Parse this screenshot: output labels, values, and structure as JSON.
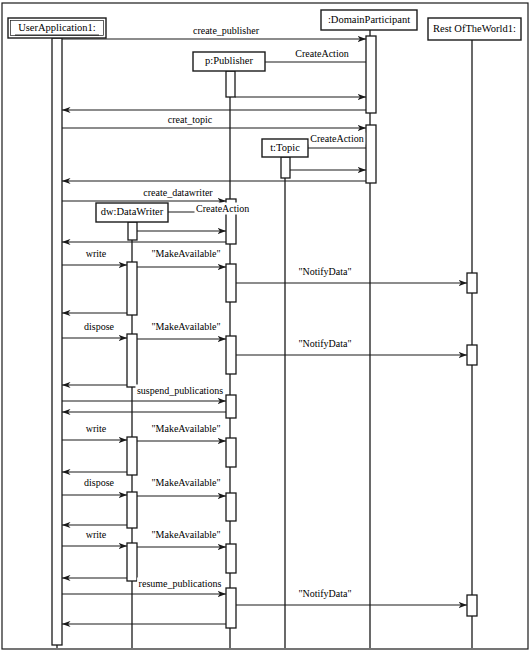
{
  "diagram": {
    "type": "uml-sequence-diagram",
    "title": "",
    "width": 530,
    "height": 654,
    "stroke_color": "#1a1a1a",
    "background_color": "#ffffff"
  },
  "participants": [
    {
      "id": "userapp",
      "label": "UserApplication1:",
      "underlined": true,
      "x": 57,
      "box": {
        "x": 8,
        "y": 18,
        "w": 98,
        "h": 20
      }
    },
    {
      "id": "datawriter",
      "label": "dw:DataWriter",
      "underlined": false,
      "x": 132,
      "box": {
        "x": 96,
        "y": 203,
        "w": 72,
        "h": 19
      }
    },
    {
      "id": "publisher",
      "label": "p:Publisher",
      "underlined": false,
      "x": 230,
      "box": {
        "x": 193,
        "y": 52,
        "w": 72,
        "h": 19
      }
    },
    {
      "id": "topic",
      "label": "t:Topic",
      "underlined": false,
      "x": 285,
      "box": {
        "x": 262,
        "y": 139,
        "w": 46,
        "h": 18
      }
    },
    {
      "id": "domainpart",
      "label": ":DomainParticipant",
      "underlined": false,
      "x": 370,
      "box": {
        "x": 321,
        "y": 10,
        "w": 96,
        "h": 20
      }
    },
    {
      "id": "restworld",
      "label": "Rest OfTheWorld1:",
      "underlined": false,
      "x": 472,
      "box": {
        "x": 428,
        "y": 18,
        "w": 93,
        "h": 22
      }
    }
  ],
  "messages": [
    {
      "id": "m1",
      "label": "create_publisher",
      "from": "userapp",
      "to": "domainpart",
      "y": 39,
      "dir": "right",
      "label_x": 226,
      "label_y": 34
    },
    {
      "id": "m2",
      "label": "CreateAction",
      "from": "domainpart",
      "to": "publisher",
      "y": 62,
      "dir": "left",
      "label_x": 322,
      "label_y": 57
    },
    {
      "id": "m3",
      "label": "",
      "from": "publisher",
      "to": "domainpart",
      "y": 97,
      "dir": "right",
      "label_x": 300,
      "label_y": 92
    },
    {
      "id": "m4",
      "label": "",
      "from": "domainpart",
      "to": "userapp",
      "y": 110,
      "dir": "left",
      "label_x": 200,
      "label_y": 105
    },
    {
      "id": "m5",
      "label": "creat_topic",
      "from": "userapp",
      "to": "domainpart",
      "y": 128,
      "dir": "right",
      "label_x": 190,
      "label_y": 123
    },
    {
      "id": "m6",
      "label": "CreateAction",
      "from": "domainpart",
      "to": "topic",
      "y": 148,
      "dir": "left",
      "label_x": 337,
      "label_y": 142
    },
    {
      "id": "m7",
      "label": "",
      "from": "topic",
      "to": "domainpart",
      "y": 170,
      "dir": "right",
      "label_x": 330,
      "label_y": 165
    },
    {
      "id": "m8",
      "label": "",
      "from": "domainpart",
      "to": "userapp",
      "y": 181,
      "dir": "left",
      "label_x": 200,
      "label_y": 176
    },
    {
      "id": "m9",
      "label": "create_datawriter",
      "from": "userapp",
      "to": "publisher",
      "y": 201,
      "dir": "right",
      "label_x": 178,
      "label_y": 196
    },
    {
      "id": "m10",
      "label": "CreateAction",
      "from": "publisher",
      "to": "datawriter",
      "y": 212,
      "dir": "left",
      "label_x": 196,
      "label_y": 212
    },
    {
      "id": "m11",
      "label": "",
      "from": "datawriter",
      "to": "publisher",
      "y": 231,
      "dir": "right",
      "label_x": 180,
      "label_y": 226
    },
    {
      "id": "m12",
      "label": "",
      "from": "publisher",
      "to": "userapp",
      "y": 242,
      "dir": "left",
      "label_x": 140,
      "label_y": 237
    },
    {
      "id": "m13",
      "label": "write",
      "from": "userapp",
      "to": "datawriter",
      "y": 265,
      "dir": "right",
      "label_x": 96,
      "label_y": 257
    },
    {
      "id": "m14",
      "label": "\"MakeAvailable\"",
      "from": "datawriter",
      "to": "publisher",
      "y": 267,
      "dir": "right",
      "label_x": 186,
      "label_y": 257
    },
    {
      "id": "m15",
      "label": "\"NotifyData\"",
      "from": "publisher",
      "to": "restworld",
      "y": 283,
      "dir": "right",
      "label_x": 325,
      "label_y": 275
    },
    {
      "id": "m16",
      "label": "",
      "from": "datawriter",
      "to": "userapp",
      "y": 313,
      "dir": "left",
      "label_x": 96,
      "label_y": 308
    },
    {
      "id": "m17",
      "label": "dispose",
      "from": "userapp",
      "to": "datawriter",
      "y": 338,
      "dir": "right",
      "label_x": 99,
      "label_y": 330
    },
    {
      "id": "m18",
      "label": "\"MakeAvailable\"",
      "from": "datawriter",
      "to": "publisher",
      "y": 339,
      "dir": "right",
      "label_x": 186,
      "label_y": 330
    },
    {
      "id": "m19",
      "label": "\"NotifyData\"",
      "from": "publisher",
      "to": "restworld",
      "y": 355,
      "dir": "right",
      "label_x": 325,
      "label_y": 347
    },
    {
      "id": "m20",
      "label": "",
      "from": "datawriter",
      "to": "userapp",
      "y": 385,
      "dir": "left",
      "label_x": 96,
      "label_y": 380
    },
    {
      "id": "m21",
      "label": "suspend_publications",
      "from": "userapp",
      "to": "publisher",
      "y": 401,
      "dir": "right",
      "label_x": 180,
      "label_y": 394
    },
    {
      "id": "m22",
      "label": "",
      "from": "publisher",
      "to": "userapp",
      "y": 412,
      "dir": "left",
      "label_x": 140,
      "label_y": 407
    },
    {
      "id": "m23",
      "label": "write",
      "from": "userapp",
      "to": "datawriter",
      "y": 440,
      "dir": "right",
      "label_x": 96,
      "label_y": 432
    },
    {
      "id": "m24",
      "label": "\"MakeAvailable\"",
      "from": "datawriter",
      "to": "publisher",
      "y": 441,
      "dir": "right",
      "label_x": 186,
      "label_y": 432
    },
    {
      "id": "m25",
      "label": "",
      "from": "datawriter",
      "to": "userapp",
      "y": 472,
      "dir": "left",
      "label_x": 96,
      "label_y": 467
    },
    {
      "id": "m26",
      "label": "dispose",
      "from": "userapp",
      "to": "datawriter",
      "y": 495,
      "dir": "right",
      "label_x": 99,
      "label_y": 486
    },
    {
      "id": "m27",
      "label": "\"MakeAvailable\"",
      "from": "datawriter",
      "to": "publisher",
      "y": 496,
      "dir": "right",
      "label_x": 186,
      "label_y": 486
    },
    {
      "id": "m28",
      "label": "",
      "from": "datawriter",
      "to": "userapp",
      "y": 525,
      "dir": "left",
      "label_x": 96,
      "label_y": 520
    },
    {
      "id": "m29",
      "label": "write",
      "from": "userapp",
      "to": "datawriter",
      "y": 546,
      "dir": "right",
      "label_x": 96,
      "label_y": 538
    },
    {
      "id": "m30",
      "label": "\"MakeAvailable\"",
      "from": "datawriter",
      "to": "publisher",
      "y": 547,
      "dir": "right",
      "label_x": 186,
      "label_y": 538
    },
    {
      "id": "m31",
      "label": "",
      "from": "datawriter",
      "to": "userapp",
      "y": 578,
      "dir": "left",
      "label_x": 96,
      "label_y": 573
    },
    {
      "id": "m32",
      "label": "resume_publications",
      "from": "userapp",
      "to": "publisher",
      "y": 594,
      "dir": "right",
      "label_x": 180,
      "label_y": 587
    },
    {
      "id": "m33",
      "label": "\"NotifyData\"",
      "from": "publisher",
      "to": "restworld",
      "y": 605,
      "dir": "right",
      "label_x": 325,
      "label_y": 597
    },
    {
      "id": "m34",
      "label": "",
      "from": "publisher",
      "to": "userapp",
      "y": 624,
      "dir": "left",
      "label_x": 140,
      "label_y": 619
    }
  ],
  "activations": [
    {
      "id": "a-userapp",
      "participant": "userapp",
      "x": 52,
      "y": 38,
      "w": 10,
      "h": 607
    },
    {
      "id": "a-dp-1",
      "participant": "domainpart",
      "x": 366,
      "y": 36,
      "w": 10,
      "h": 77
    },
    {
      "id": "a-pub-create",
      "participant": "publisher",
      "x": 226,
      "y": 71,
      "w": 9,
      "h": 26
    },
    {
      "id": "a-dp-2",
      "participant": "domainpart",
      "x": 366,
      "y": 125,
      "w": 10,
      "h": 58
    },
    {
      "id": "a-topic-create",
      "participant": "topic",
      "x": 281,
      "y": 157,
      "w": 9,
      "h": 21
    },
    {
      "id": "a-pub-2",
      "participant": "publisher",
      "x": 226,
      "y": 199,
      "w": 10,
      "h": 45
    },
    {
      "id": "a-dw-create",
      "participant": "datawriter",
      "x": 128,
      "y": 222,
      "w": 9,
      "h": 18
    },
    {
      "id": "a-dw-w1",
      "participant": "datawriter",
      "x": 127,
      "y": 262,
      "w": 10,
      "h": 53
    },
    {
      "id": "a-pub-w1",
      "participant": "publisher",
      "x": 226,
      "y": 264,
      "w": 10,
      "h": 38
    },
    {
      "id": "a-rw-1",
      "participant": "restworld",
      "x": 467,
      "y": 273,
      "w": 10,
      "h": 20
    },
    {
      "id": "a-dw-d1",
      "participant": "datawriter",
      "x": 127,
      "y": 334,
      "w": 10,
      "h": 53
    },
    {
      "id": "a-pub-d1",
      "participant": "publisher",
      "x": 226,
      "y": 336,
      "w": 10,
      "h": 38
    },
    {
      "id": "a-rw-2",
      "participant": "restworld",
      "x": 467,
      "y": 345,
      "w": 10,
      "h": 20
    },
    {
      "id": "a-pub-susp",
      "participant": "publisher",
      "x": 226,
      "y": 395,
      "w": 10,
      "h": 23
    },
    {
      "id": "a-dw-w2",
      "participant": "datawriter",
      "x": 127,
      "y": 437,
      "w": 10,
      "h": 38
    },
    {
      "id": "a-pub-w2",
      "participant": "publisher",
      "x": 226,
      "y": 438,
      "w": 10,
      "h": 29
    },
    {
      "id": "a-dw-d2",
      "participant": "datawriter",
      "x": 127,
      "y": 492,
      "w": 10,
      "h": 36
    },
    {
      "id": "a-pub-d2",
      "participant": "publisher",
      "x": 226,
      "y": 493,
      "w": 10,
      "h": 28
    },
    {
      "id": "a-dw-w3",
      "participant": "datawriter",
      "x": 127,
      "y": 543,
      "w": 10,
      "h": 38
    },
    {
      "id": "a-pub-w3",
      "participant": "publisher",
      "x": 226,
      "y": 544,
      "w": 10,
      "h": 29
    },
    {
      "id": "a-pub-res",
      "participant": "publisher",
      "x": 226,
      "y": 588,
      "w": 10,
      "h": 40
    },
    {
      "id": "a-rw-3",
      "participant": "restworld",
      "x": 467,
      "y": 595,
      "w": 10,
      "h": 21
    }
  ],
  "frame": {
    "x": 2,
    "y": 3,
    "w": 526,
    "h": 646
  }
}
